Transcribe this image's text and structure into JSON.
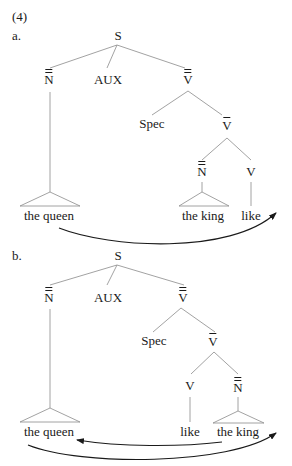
{
  "example_number": "(4)",
  "trees": [
    {
      "label": "a.",
      "nodes": {
        "S": "S",
        "NP": "N",
        "AUX": "AUX",
        "VP": "V",
        "Spec": "Spec",
        "Vbar": "V",
        "NP2": "N",
        "V": "V"
      },
      "leaves": {
        "queen": "the queen",
        "king": "the king",
        "like": "like"
      },
      "arrows": [
        {
          "from": "the queen",
          "to": "after like"
        }
      ]
    },
    {
      "label": "b.",
      "nodes": {
        "S": "S",
        "NP": "N",
        "AUX": "AUX",
        "VP": "V",
        "Spec": "Spec",
        "Vbar": "V",
        "V": "V",
        "NP2": "N"
      },
      "leaves": {
        "queen": "the queen",
        "like": "like",
        "king": "the king"
      },
      "arrows": [
        {
          "from": "the king",
          "to": "the queen"
        },
        {
          "from": "the queen",
          "to": "after the king"
        }
      ]
    }
  ]
}
